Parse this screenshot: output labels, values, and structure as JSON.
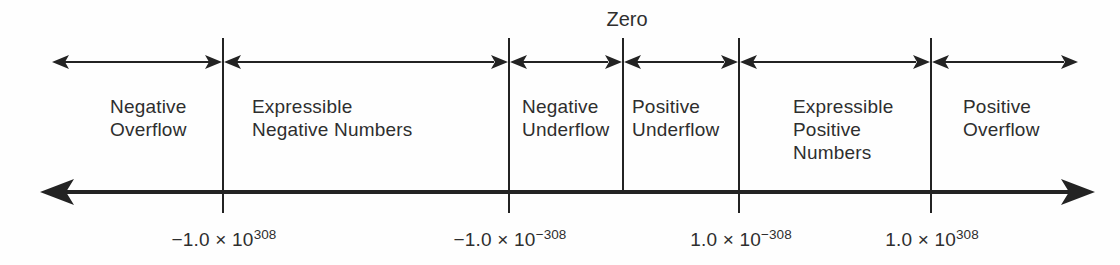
{
  "figure": {
    "zero_label": "Zero",
    "regions": [
      {
        "id": "negative-overflow",
        "lines": [
          "Negative",
          "Overflow"
        ]
      },
      {
        "id": "expressible-negative-numbers",
        "lines": [
          "Expressible",
          "Negative Numbers"
        ]
      },
      {
        "id": "negative-underflow",
        "lines": [
          "Negative",
          "Underflow"
        ]
      },
      {
        "id": "positive-underflow",
        "lines": [
          "Positive",
          "Underflow"
        ]
      },
      {
        "id": "expressible-positive-numbers",
        "lines": [
          "Expressible",
          "Positive",
          "Numbers"
        ]
      },
      {
        "id": "positive-overflow",
        "lines": [
          "Positive",
          "Overflow"
        ]
      }
    ],
    "boundary_values": [
      {
        "id": "negative-max",
        "base": "−1.0 × 10",
        "exp": "308"
      },
      {
        "id": "negative-min",
        "base": "−1.0 × 10",
        "exp": "−308"
      },
      {
        "id": "positive-min",
        "base": "1.0 × 10",
        "exp": "−308"
      },
      {
        "id": "positive-max",
        "base": "1.0 × 10",
        "exp": "308"
      }
    ],
    "colors": {
      "ink": "#1f1f1f",
      "background": "#fefefe"
    }
  }
}
